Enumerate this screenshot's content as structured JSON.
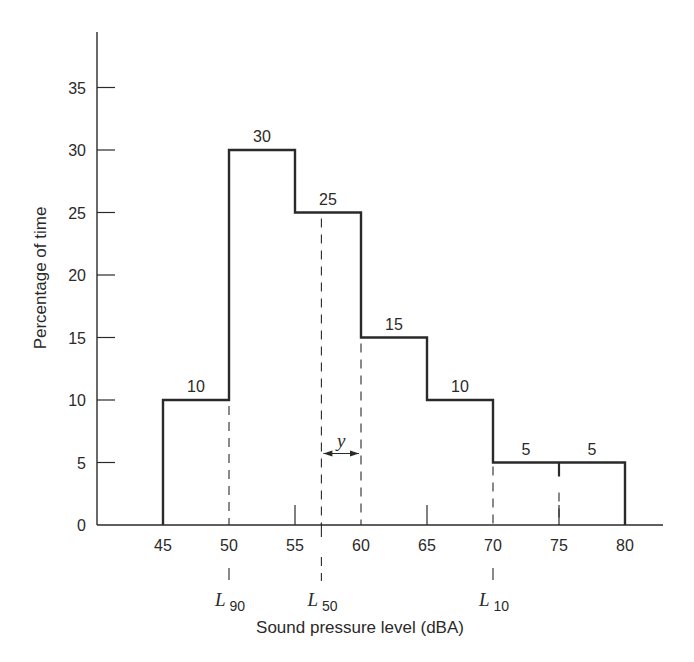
{
  "chart_data": {
    "type": "bar",
    "subtype": "histogram",
    "title": "",
    "xlabel": "Sound pressure level (dBA)",
    "ylabel": "Percentage of time",
    "bins": [
      {
        "from": 45,
        "to": 50,
        "value": 10,
        "label": "10"
      },
      {
        "from": 50,
        "to": 55,
        "value": 30,
        "label": "30"
      },
      {
        "from": 55,
        "to": 60,
        "value": 25,
        "label": "25"
      },
      {
        "from": 60,
        "to": 65,
        "value": 15,
        "label": "15"
      },
      {
        "from": 65,
        "to": 70,
        "value": 10,
        "label": "10"
      },
      {
        "from": 70,
        "to": 75,
        "value": 5,
        "label": "5"
      },
      {
        "from": 75,
        "to": 80,
        "value": 5,
        "label": "5"
      }
    ],
    "categories": [
      "45-50",
      "50-55",
      "55-60",
      "60-65",
      "65-70",
      "70-75",
      "75-80"
    ],
    "values": [
      10,
      30,
      25,
      15,
      10,
      5,
      5
    ],
    "x_ticks": [
      45,
      50,
      55,
      60,
      65,
      70,
      75,
      80
    ],
    "y_ticks": [
      0,
      5,
      10,
      15,
      20,
      25,
      30,
      35
    ],
    "xlim": [
      40,
      82
    ],
    "ylim": [
      0,
      38
    ],
    "grid": false,
    "legend": null,
    "annotations": [
      {
        "type": "percentile-marker",
        "name": "L",
        "sub": "90",
        "x": 50
      },
      {
        "type": "percentile-marker",
        "name": "L",
        "sub": "50",
        "x": 57
      },
      {
        "type": "percentile-marker",
        "name": "L",
        "sub": "10",
        "x": 70
      },
      {
        "type": "dimension",
        "label": "y",
        "from": 57,
        "to": 60,
        "y": 5
      }
    ]
  }
}
